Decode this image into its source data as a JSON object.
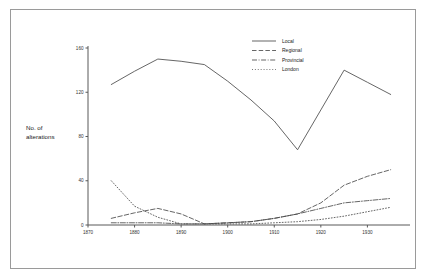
{
  "figure": {
    "background_color": "#ffffff",
    "frame_color": "#9a9a9a",
    "line_color": "#4a4a4a",
    "axis_color": "#595959"
  },
  "axis": {
    "y_title_line1": "No. of",
    "y_title_line2": "alterations",
    "y_ticks": [
      "0",
      "40",
      "80",
      "120",
      "160"
    ],
    "x_ticks": [
      "1870",
      "1880",
      "1890",
      "1900",
      "1910",
      "1920",
      "1930"
    ]
  },
  "legend": {
    "entries": [
      {
        "label": "Local",
        "style": "solid"
      },
      {
        "label": "Regional",
        "style": "dashed"
      },
      {
        "label": "Provincial",
        "style": "dash-dot"
      },
      {
        "label": "London",
        "style": "dotted"
      }
    ]
  },
  "chart_data": {
    "type": "line",
    "title": "",
    "xlabel": "",
    "ylabel": "No. of alterations",
    "xlim": [
      1870,
      1937
    ],
    "ylim": [
      0,
      160
    ],
    "grid": false,
    "legend_position": "top-right",
    "x_ticks": [
      1870,
      1880,
      1890,
      1900,
      1910,
      1920,
      1930
    ],
    "y_ticks": [
      0,
      40,
      80,
      120,
      160
    ],
    "series": [
      {
        "name": "Local",
        "style": "solid",
        "x": [
          1875,
          1880,
          1885,
          1890,
          1895,
          1900,
          1905,
          1910,
          1915,
          1920,
          1925,
          1930,
          1935
        ],
        "values": [
          127,
          139,
          150,
          148,
          145,
          130,
          113,
          94,
          68,
          104,
          140,
          129,
          118
        ]
      },
      {
        "name": "Regional",
        "style": "dashed",
        "x": [
          1875,
          1880,
          1885,
          1890,
          1895,
          1900,
          1905,
          1910,
          1915,
          1920,
          1925,
          1930,
          1935
        ],
        "values": [
          6,
          11,
          15,
          10,
          1,
          2,
          3,
          6,
          10,
          20,
          36,
          44,
          50
        ]
      },
      {
        "name": "Provincial",
        "style": "dash-dot",
        "x": [
          1875,
          1880,
          1885,
          1890,
          1895,
          1900,
          1905,
          1910,
          1915,
          1920,
          1925,
          1930,
          1935
        ],
        "values": [
          2,
          2,
          2,
          1,
          1,
          2,
          3,
          6,
          10,
          15,
          20,
          22,
          24
        ]
      },
      {
        "name": "London",
        "style": "dotted",
        "x": [
          1875,
          1880,
          1885,
          1890,
          1895,
          1900,
          1905,
          1910,
          1915,
          1920,
          1925,
          1930,
          1935
        ],
        "values": [
          40,
          17,
          7,
          1,
          1,
          1,
          1,
          2,
          3,
          5,
          8,
          12,
          16
        ]
      }
    ]
  }
}
